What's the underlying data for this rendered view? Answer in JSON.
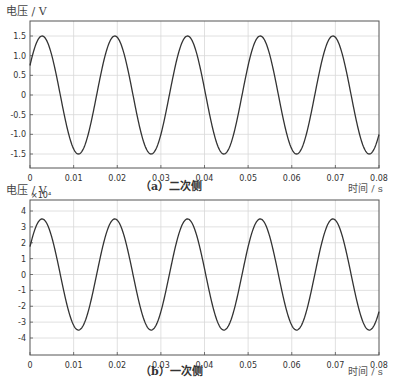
{
  "chart_data": [
    {
      "type": "line",
      "id": "a",
      "caption": "（a）二次侧",
      "ylabel": "电压 / V",
      "xlabel": "时间 / s",
      "y_multiplier": "",
      "xlim": [
        0,
        0.08
      ],
      "ylim": [
        -1.75,
        1.75
      ],
      "grid": true,
      "x_ticks": [
        0,
        0.01,
        0.02,
        0.03,
        0.04,
        0.05,
        0.06,
        0.07,
        0.08
      ],
      "x_tick_labels": [
        "0",
        "0.01",
        "0.02",
        "0.03",
        "0.04",
        "0.05",
        "0.06",
        "0.07",
        "0.08"
      ],
      "y_ticks": [
        1.5,
        1.0,
        0.5,
        0,
        -0.5,
        -1.0,
        -1.5
      ],
      "y_tick_labels": [
        "1.5",
        "1.0",
        "0.5",
        "0",
        "-0.5",
        "-1.0",
        "-1.5"
      ],
      "series": [
        {
          "name": "secondary voltage",
          "amplitude": 1.5,
          "frequency_hz": 60,
          "phase_deg": 30,
          "x": [
            0,
            0.0028,
            0.0069,
            0.0111,
            0.0153,
            0.0194,
            0.0236,
            0.0278,
            0.0319,
            0.0361,
            0.0403,
            0.0444,
            0.0486,
            0.0528,
            0.0569,
            0.0611,
            0.0653,
            0.0694,
            0.0736,
            0.0778,
            0.08
          ],
          "values": [
            0.75,
            1.5,
            0,
            -1.5,
            0,
            1.5,
            0,
            -1.5,
            0,
            1.5,
            0,
            -1.5,
            0,
            1.5,
            0,
            -1.5,
            0,
            1.5,
            0,
            -1.5,
            -1.06
          ]
        }
      ]
    },
    {
      "type": "line",
      "id": "b",
      "caption": "（b）一次侧",
      "ylabel": "电压 / V",
      "xlabel": "时间 / s",
      "y_multiplier": "×10⁴",
      "xlim": [
        0,
        0.08
      ],
      "ylim": [
        -4.5,
        4.5
      ],
      "grid": true,
      "x_ticks": [
        0,
        0.01,
        0.02,
        0.03,
        0.04,
        0.05,
        0.06,
        0.07,
        0.08
      ],
      "x_tick_labels": [
        "0",
        "0.01",
        "0.02",
        "0.03",
        "0.04",
        "0.05",
        "0.06",
        "0.07",
        "0.08"
      ],
      "y_ticks": [
        4,
        3,
        2,
        1,
        0,
        -1,
        -2,
        -3,
        -4
      ],
      "y_tick_labels": [
        "4",
        "3",
        "2",
        "1",
        "0",
        "-1",
        "-2",
        "-3",
        "-4"
      ],
      "series": [
        {
          "name": "primary voltage (×10⁴ V)",
          "amplitude": 3.5,
          "frequency_hz": 60,
          "phase_deg": 30,
          "x": [
            0,
            0.0028,
            0.0069,
            0.0111,
            0.0153,
            0.0194,
            0.0236,
            0.0278,
            0.0319,
            0.0361,
            0.0403,
            0.0444,
            0.0486,
            0.0528,
            0.0569,
            0.0611,
            0.0653,
            0.0694,
            0.0736,
            0.0778,
            0.08
          ],
          "values": [
            1.75,
            3.5,
            0,
            -3.5,
            0,
            3.5,
            0,
            -3.5,
            0,
            3.5,
            0,
            -3.5,
            0,
            3.5,
            0,
            -3.5,
            0,
            3.5,
            0,
            -3.5,
            -2.47
          ]
        }
      ]
    }
  ],
  "colors": {
    "line": "#333333",
    "grid": "#d8d8d8",
    "frame": "#555555"
  }
}
